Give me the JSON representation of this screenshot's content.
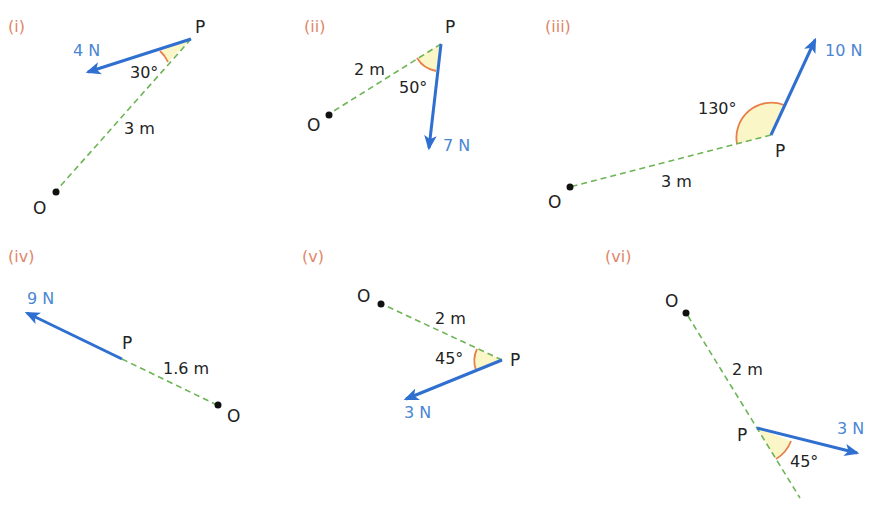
{
  "colors": {
    "part_label": "#e0866a",
    "force": "#2f6fd0",
    "force_label": "#4a86d4",
    "dashed_line": "#6cb454",
    "angle_arc": "#e8804a",
    "angle_fill": "#fbf6c8",
    "point": "#111111"
  },
  "diagrams": [
    {
      "id": "i",
      "part_label": "(i)",
      "point_p": "P",
      "point_o": "O",
      "distance": "3 m",
      "angle": "30°",
      "force": "4 N"
    },
    {
      "id": "ii",
      "part_label": "(ii)",
      "point_p": "P",
      "point_o": "O",
      "distance": "2 m",
      "angle": "50°",
      "force": "7 N"
    },
    {
      "id": "iii",
      "part_label": "(iii)",
      "point_p": "P",
      "point_o": "O",
      "distance": "3 m",
      "angle": "130°",
      "force": "10 N"
    },
    {
      "id": "iv",
      "part_label": "(iv)",
      "point_p": "P",
      "point_o": "O",
      "distance": "1.6 m",
      "angle": null,
      "force": "9 N"
    },
    {
      "id": "v",
      "part_label": "(v)",
      "point_p": "P",
      "point_o": "O",
      "distance": "2 m",
      "angle": "45°",
      "force": "3 N"
    },
    {
      "id": "vi",
      "part_label": "(vi)",
      "point_p": "P",
      "point_o": "O",
      "distance": "2 m",
      "angle": "45°",
      "force": "3 N"
    }
  ]
}
